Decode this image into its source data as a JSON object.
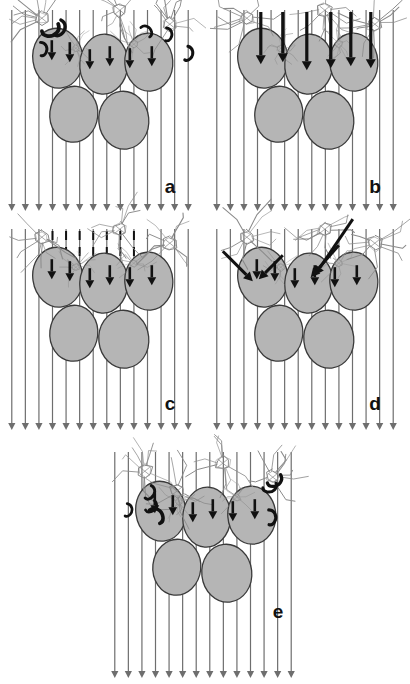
{
  "figure": {
    "width": 410,
    "height": 684,
    "background_color": "#ffffff",
    "panel_count": 5,
    "layout": "2 columns x 2 rows plus one centered bottom panel"
  },
  "style": {
    "cell_fill": "#b5b5b5",
    "cell_stroke": "#3a3a3a",
    "flow_line_color": "#6e6e6e",
    "thick_arrow_color": "#111111",
    "dashed_line_color": "#111111",
    "phage_sketch_color": "#8a8a8a",
    "phage_dark_color": "#2b2b2b",
    "hook_color": "#111111",
    "label_color": "#111111"
  },
  "panels": [
    {
      "id": "a",
      "label": "a",
      "label_x": 170,
      "label_y": 193,
      "x": 5,
      "y": 6,
      "width": 190,
      "height": 205,
      "flow_line_count": 14,
      "flow_line_style": "solid-gray",
      "flow_arrow_count": 14,
      "has_thick_vertical_arrows": true,
      "thick_arrow_style": "short-vertical-onto-cells",
      "has_diagonal_arrows": false,
      "has_dashed_lines": false,
      "phage_count": 3,
      "hook_count": 6,
      "description": "Free phages approach; several short thick arrows deposit onto the upper cell surfaces; curved hook shapes float in the flow."
    },
    {
      "id": "b",
      "label": "b",
      "label_x": 375,
      "label_y": 193,
      "x": 210,
      "y": 6,
      "width": 190,
      "height": 205,
      "flow_line_count": 14,
      "flow_line_style": "solid-gray",
      "flow_arrow_count": 14,
      "has_thick_vertical_arrows": true,
      "thick_arrow_style": "long-bold-vertical",
      "has_diagonal_arrows": false,
      "has_dashed_lines": false,
      "phage_count": 3,
      "hook_count": 0,
      "description": "Long bold vertical arrows drive phages straight down onto the cell cluster; no free hooks remain in suspension."
    },
    {
      "id": "c",
      "label": "c",
      "label_x": 170,
      "label_y": 410,
      "x": 5,
      "y": 225,
      "width": 190,
      "height": 205,
      "flow_line_count": 14,
      "flow_line_style": "solid-gray-with-dashed-zone",
      "flow_arrow_count": 14,
      "has_thick_vertical_arrows": true,
      "thick_arrow_style": "short-vertical-onto-cells",
      "has_diagonal_arrows": false,
      "has_dashed_lines": true,
      "dashed_line_count": 6,
      "phage_count": 3,
      "hook_count": 0,
      "description": "Dashed black segments mark interrupted streamlines above the cluster; short thick arrows still reach the cells."
    },
    {
      "id": "d",
      "label": "d",
      "label_x": 375,
      "label_y": 410,
      "x": 210,
      "y": 225,
      "width": 190,
      "height": 205,
      "flow_line_count": 14,
      "flow_line_style": "solid-gray",
      "flow_arrow_count": 14,
      "has_thick_vertical_arrows": true,
      "thick_arrow_style": "short-vertical-onto-cells",
      "has_diagonal_arrows": true,
      "diagonal_arrow_count": 4,
      "has_dashed_lines": false,
      "phage_count": 3,
      "hook_count": 0,
      "description": "Bold diagonal arrows angle down-left, steering phages laterally onto the cluster edge."
    },
    {
      "id": "e",
      "label": "e",
      "label_x": 278,
      "label_y": 618,
      "x": 108,
      "y": 448,
      "width": 190,
      "height": 230,
      "flow_line_count": 14,
      "flow_line_style": "solid-gray",
      "flow_arrow_count": 14,
      "has_thick_vertical_arrows": true,
      "thick_arrow_style": "short-vertical-onto-cells",
      "has_diagonal_arrows": false,
      "has_dashed_lines": false,
      "phage_count": 4,
      "hook_count": 7,
      "description": "Final state: phages bound at both flanks of the cluster with many free hook shapes drifting in the flow."
    }
  ],
  "cell_cluster": {
    "cell_count": 5,
    "top_row_count": 3,
    "bottom_row_count": 2,
    "cells": [
      {
        "index": 0,
        "row": "top",
        "cx": -46,
        "cy": -38,
        "rx": 25,
        "ry": 30,
        "rot": -8
      },
      {
        "index": 1,
        "row": "top",
        "cx": 0,
        "cy": -32,
        "rx": 24,
        "ry": 30,
        "rot": 4
      },
      {
        "index": 2,
        "row": "top",
        "cx": 45,
        "cy": -34,
        "rx": 24,
        "ry": 29,
        "rot": -4
      },
      {
        "index": 3,
        "row": "bottom",
        "cx": -30,
        "cy": 18,
        "rx": 24,
        "ry": 28,
        "rot": 6
      },
      {
        "index": 4,
        "row": "bottom",
        "cx": 20,
        "cy": 24,
        "rx": 25,
        "ry": 29,
        "rot": -6
      }
    ]
  }
}
